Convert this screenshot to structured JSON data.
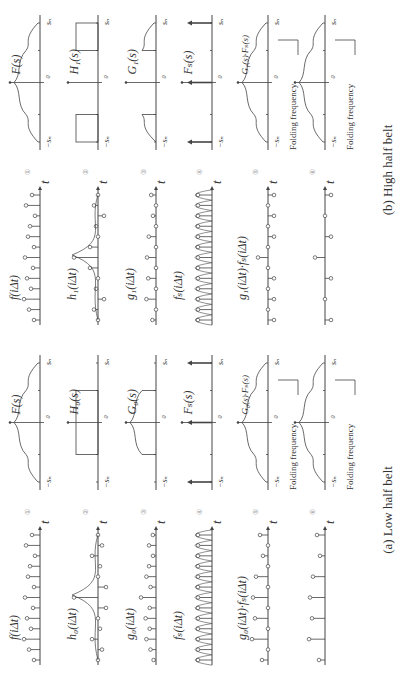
{
  "figure": {
    "panels": [
      {
        "id": "a",
        "caption": "(a)  Low half belt",
        "rows": [
          {
            "num": "①",
            "time_label": "f(iΔt)",
            "freq_label": "F(s)"
          },
          {
            "num": "②",
            "time_label": "h₀(iΔt)",
            "freq_label": "H₀(s)"
          },
          {
            "num": "③",
            "time_label": "g₀(iΔt)",
            "freq_label": "G₀(s)"
          },
          {
            "num": "④",
            "time_label": "fₛ(iΔt)",
            "freq_label": "Fₛ(s)"
          },
          {
            "num": "⑤",
            "time_label": "g₀(iΔt)·fₛ(iΔt)",
            "freq_label": "G₀(s)·Fₛ(s)",
            "annotation": "Folding frequency"
          },
          {
            "num": "⑥",
            "time_label": "",
            "freq_label": "",
            "annotation": "Folding frequency"
          }
        ]
      },
      {
        "id": "b",
        "caption": "(b)  High half belt",
        "rows": [
          {
            "num": "①",
            "time_label": "f(iΔt)",
            "freq_label": "F(s)"
          },
          {
            "num": "②",
            "time_label": "h₁(iΔt)",
            "freq_label": "H₁(s)"
          },
          {
            "num": "③",
            "time_label": "g₁(iΔt)",
            "freq_label": "G₁(s)"
          },
          {
            "num": "④",
            "time_label": "fₛ(iΔt)",
            "freq_label": "Fₛ(s)"
          },
          {
            "num": "⑤",
            "time_label": "g₁(iΔt)·fₛ(iΔt)",
            "freq_label": "G₁(s)·Fₛ(s)",
            "annotation": "Folding frequency"
          },
          {
            "num": "⑥",
            "time_label": "",
            "freq_label": "",
            "annotation": "Folding frequency"
          }
        ]
      }
    ],
    "axis": {
      "time_var": "t",
      "freq_neg": "−sₙ",
      "freq_pos": "sₙ",
      "origin": "0"
    }
  }
}
